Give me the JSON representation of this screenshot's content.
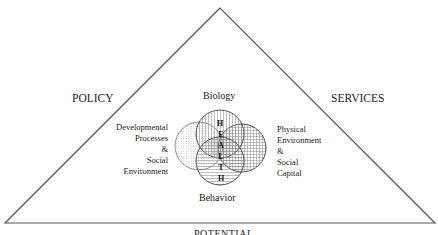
{
  "diagram": {
    "corners": {
      "left": "POLICY",
      "right": "SERVICES",
      "bottom": "POTENTIAL"
    },
    "circles": {
      "top": "Biology",
      "bottom": "Behavior",
      "left": [
        "Developmental",
        "Processes",
        "&",
        "Social",
        "Environment"
      ],
      "right": [
        "Physical",
        "Environment",
        "&",
        "Social",
        "Capital"
      ]
    },
    "center_word": [
      "H",
      "E",
      "A",
      "L",
      "T",
      "H"
    ],
    "colors": {
      "line": "#555555",
      "circle_stroke": "#444444",
      "hatch": "#777777"
    }
  }
}
